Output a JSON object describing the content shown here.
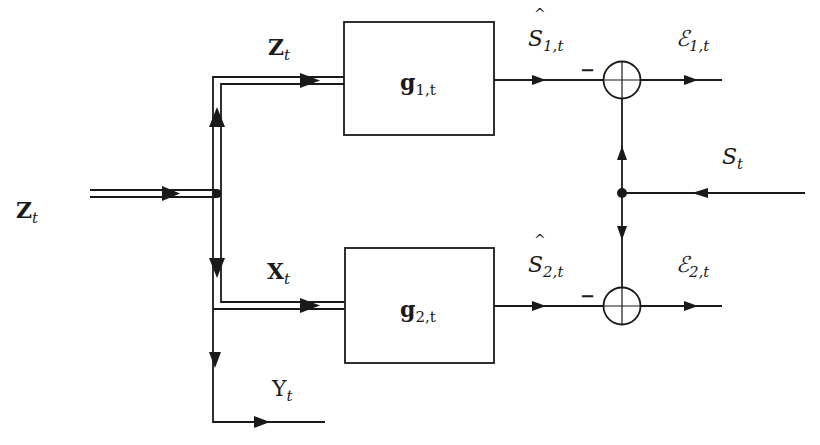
{
  "diagram": {
    "input": {
      "label_main": "Z",
      "label_sub": "t"
    },
    "top_branch": {
      "label_main": "Z",
      "label_sub": "t"
    },
    "bottom_branch": {
      "label_main": "X",
      "label_sub": "t"
    },
    "side_output": {
      "label_main": "Y",
      "label_sub": "t"
    },
    "block1": {
      "label_main": "g",
      "label_sub": "1,t"
    },
    "block2": {
      "label_main": "g",
      "label_sub": "2,t"
    },
    "estimate1": {
      "label_hat": "^",
      "label_main": "S",
      "label_sub": "1,t"
    },
    "estimate2": {
      "label_hat": "^",
      "label_main": "S",
      "label_sub": "2,t"
    },
    "summer1": {
      "sign": "−"
    },
    "summer2": {
      "sign": "−"
    },
    "error1": {
      "label_main": "ℰ",
      "label_sub": "1,t"
    },
    "error2": {
      "label_main": "ℰ",
      "label_sub": "2,t"
    },
    "reference": {
      "label_main": "S",
      "label_sub": "t"
    }
  }
}
